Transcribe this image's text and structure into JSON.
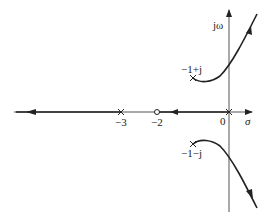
{
  "diagram": {
    "type": "root-locus",
    "axes": {
      "real_label": "σ",
      "imag_label": "jω",
      "origin_label": "0"
    },
    "poles": [
      {
        "label": "−1+j",
        "re": -1,
        "im": 1
      },
      {
        "label": "−1−j",
        "re": -1,
        "im": -1
      },
      {
        "label": "0",
        "re": 0,
        "im": 0
      },
      {
        "label": "−3",
        "re": -3,
        "im": 0
      }
    ],
    "zeros": [
      {
        "label": "−2",
        "re": -2,
        "im": 0
      }
    ],
    "tick_labels": [
      "−3",
      "−2",
      "0"
    ],
    "colors": {
      "line": "#222222",
      "axis": "#555555"
    }
  }
}
